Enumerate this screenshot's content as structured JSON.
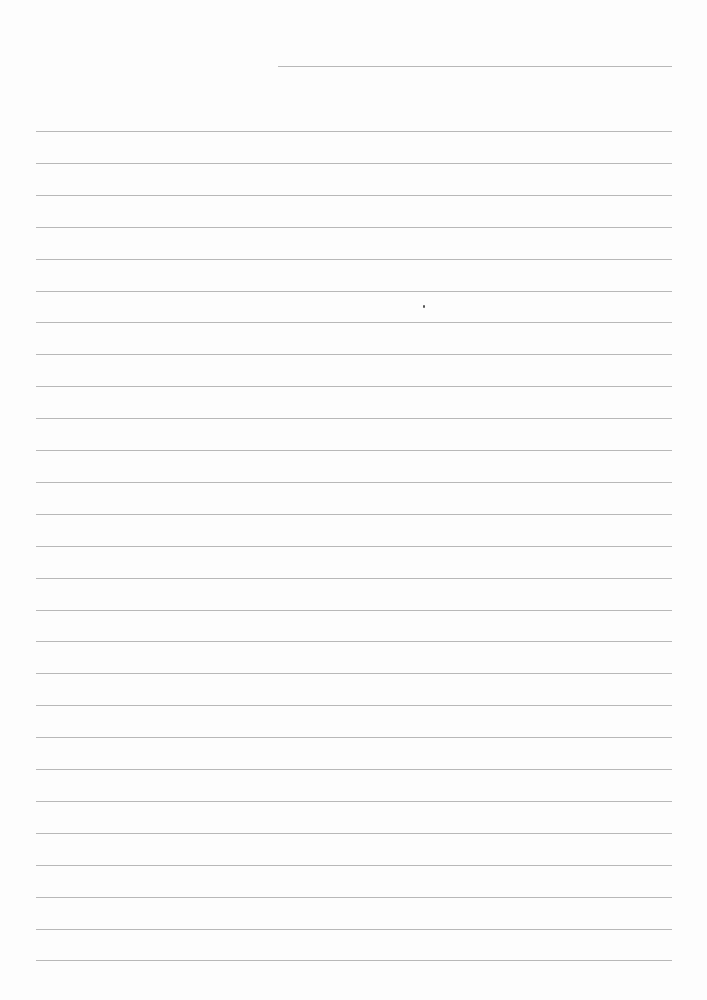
{
  "page": {
    "type": "lined-paper",
    "background": "#fdfdfd",
    "line_color": "#b8b8b8"
  },
  "header_line": {
    "x1": 278,
    "x2": 672,
    "y": 66
  },
  "ruled_lines": {
    "x1": 36,
    "x2": 672,
    "first_y": 131,
    "spacing": 31.9,
    "count": 27
  },
  "marks": [
    {
      "x": 423,
      "y": 305
    }
  ]
}
